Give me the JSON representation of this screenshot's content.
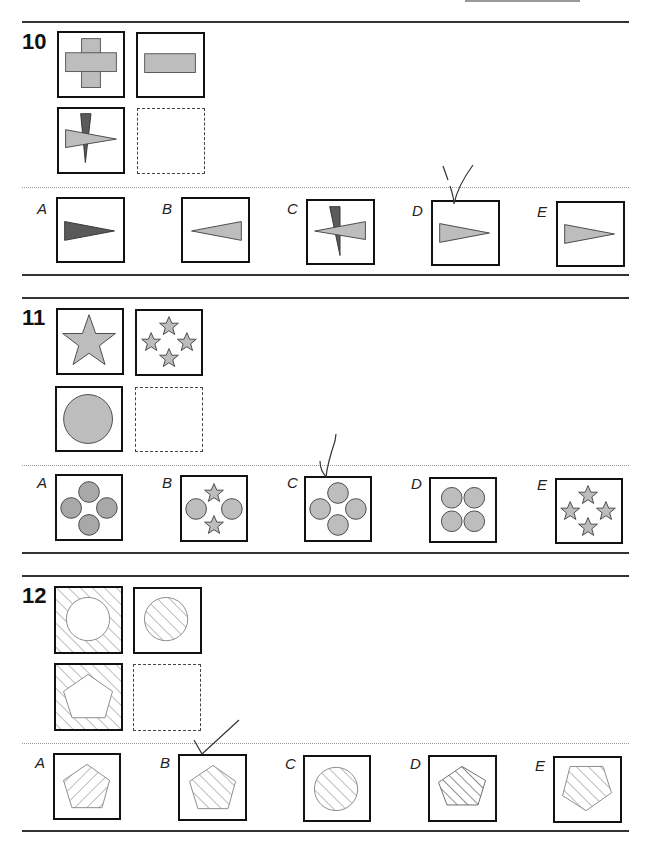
{
  "page": {
    "top_stub_line": true
  },
  "questions": [
    {
      "number": "10",
      "grid": [
        "plus shape (grey cross)",
        "horizontal bar (grey rectangle)",
        "dark vertical triangle overlapped by light horizontal triangle",
        "empty answer box"
      ],
      "options": [
        {
          "label": "A",
          "content": "dark triangle pointing right"
        },
        {
          "label": "B",
          "content": "light triangle pointing left"
        },
        {
          "label": "C",
          "content": "dark vertical triangle with light triangle pointing left"
        },
        {
          "label": "D",
          "content": "light triangle pointing right",
          "marked": true
        },
        {
          "label": "E",
          "content": "light triangle pointing right"
        }
      ]
    },
    {
      "number": "11",
      "grid": [
        "one large star",
        "four small stars",
        "one large circle",
        "empty answer box"
      ],
      "options": [
        {
          "label": "A",
          "content": "four circles in diamond (darker grey)"
        },
        {
          "label": "B",
          "content": "two circles and two stars"
        },
        {
          "label": "C",
          "content": "four circles in diamond",
          "marked": true
        },
        {
          "label": "D",
          "content": "four circles in square grid"
        },
        {
          "label": "E",
          "content": "four small stars"
        }
      ]
    },
    {
      "number": "12",
      "grid": [
        "hatched square with white circle",
        "hatched circle",
        "hatched square with white pentagon",
        "empty answer box"
      ],
      "options": [
        {
          "label": "A",
          "content": "pentagon hatched in reverse direction"
        },
        {
          "label": "B",
          "content": "hatched pentagon",
          "marked": true
        },
        {
          "label": "C",
          "content": "hatched circle"
        },
        {
          "label": "D",
          "content": "hatched pentagon, denser/darker"
        },
        {
          "label": "E",
          "content": "inverted hatched pentagon"
        }
      ]
    }
  ],
  "colors": {
    "light_fill": "#bdbdbd",
    "dark_fill": "#5a5a5a",
    "outline": "#111111",
    "hatch": "#888888"
  }
}
